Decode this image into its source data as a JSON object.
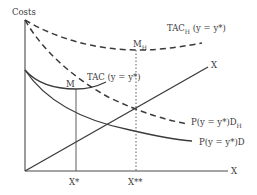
{
  "diagram": {
    "type": "economics-cost-curves",
    "axes": {
      "y_label": "Costs",
      "x_label": "X"
    },
    "curves": [
      {
        "id": "tac_h",
        "label_main": "TAC",
        "label_sub": "H",
        "label_rest": " (y = y*)",
        "style": "dashed"
      },
      {
        "id": "p_dh",
        "label_main": "P(y = y*)D",
        "label_sub": "H",
        "style": "dashed"
      },
      {
        "id": "tac",
        "label_main": "TAC (y = y*)",
        "style": "solid"
      },
      {
        "id": "p_d",
        "label_main": "P(y = y*)D",
        "style": "solid"
      },
      {
        "id": "x_line",
        "label_main": "X",
        "style": "solid"
      }
    ],
    "points": {
      "m": "M",
      "m_h_main": "M",
      "m_h_sub": "H"
    },
    "ticks": {
      "x_star": "X*",
      "x_double_star": "X**"
    }
  }
}
